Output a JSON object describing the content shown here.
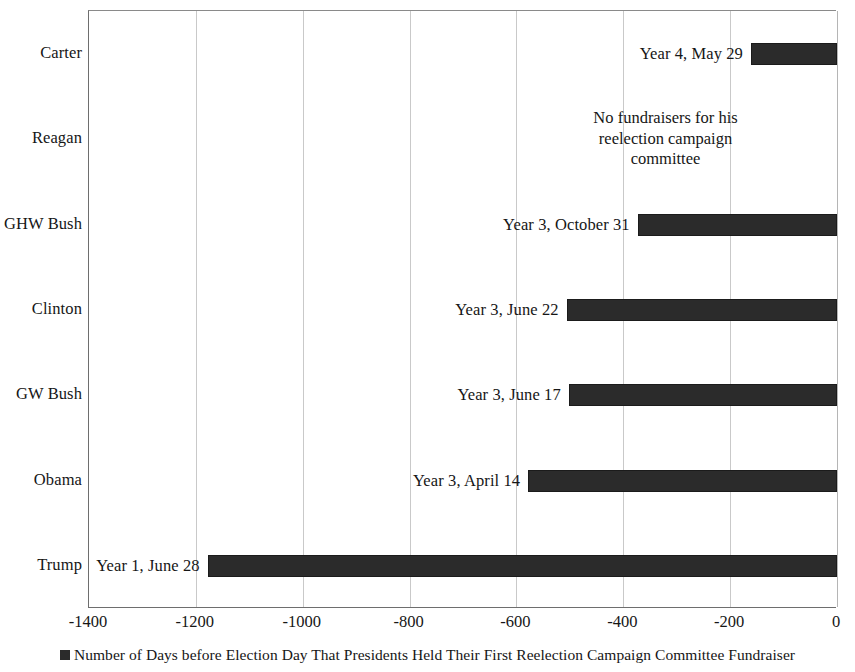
{
  "chart_data": {
    "type": "bar",
    "orientation": "horizontal",
    "title": "",
    "xlabel": "",
    "ylabel": "",
    "xlim": [
      -1400,
      0
    ],
    "xticks": [
      "-1400",
      "-1200",
      "-1000",
      "-800",
      "-600",
      "-400",
      "-200",
      "0"
    ],
    "xtick_values": [
      -1400,
      -1200,
      -1000,
      -800,
      -600,
      -400,
      -200,
      0
    ],
    "grid": true,
    "legend_position": "bottom",
    "legend": [
      "Number of Days before Election Day That Presidents Held Their First Reelection Campaign Committee Fundraiser"
    ],
    "categories": [
      "Carter",
      "Reagan",
      "GHW Bush",
      "Clinton",
      "GW Bush",
      "Obama",
      "Trump"
    ],
    "values": [
      -161,
      null,
      -373,
      -506,
      -502,
      -578,
      -1178
    ],
    "data_labels": [
      "Year 4, May 29",
      "No fundraisers for his reelection campaign committee",
      "Year 3, October 31",
      "Year 3, June 22",
      "Year 3, June 17",
      "Year 3, April 14",
      "Year 1, June 28"
    ],
    "series": [
      {
        "name": "Number of Days before Election Day That Presidents Held Their First Reelection Campaign Committee Fundraiser",
        "values": [
          -161,
          null,
          -373,
          -506,
          -502,
          -578,
          -1178
        ]
      }
    ],
    "bar_color": "#2b2b2b",
    "annotations": [
      {
        "category": "Reagan",
        "text": "No fundraisers for his reelection campaign committee",
        "kind": "no-data-note"
      }
    ]
  },
  "legend": {
    "marker": "square-marker-icon",
    "label": "Number of Days before Election Day That Presidents Held Their First Reelection Campaign Committee Fundraiser"
  }
}
